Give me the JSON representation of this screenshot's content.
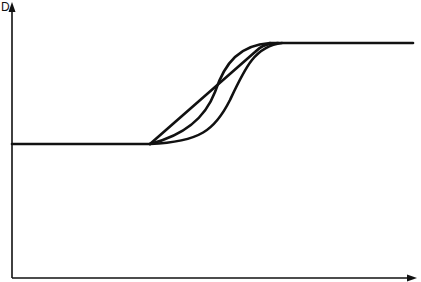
{
  "diagram": {
    "y_axis_label": "D",
    "x_axis_label": "",
    "stroke_color": "#111111",
    "background": "#ffffff",
    "lower_plateau_level": "low",
    "upper_plateau_level": "high",
    "curves": [
      {
        "name": "linear-ramp",
        "description": "near-straight transition"
      },
      {
        "name": "s-curve-early",
        "description": "sigmoidal transition, earlier"
      },
      {
        "name": "s-curve-late",
        "description": "sigmoidal transition, later"
      }
    ]
  }
}
